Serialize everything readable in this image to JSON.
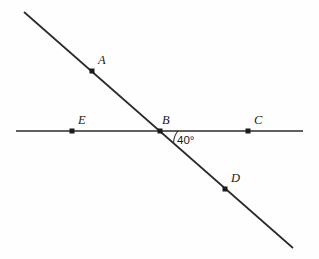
{
  "figure": {
    "background_color": "#fefefe",
    "stroke_color": "#2b2b2b",
    "dot_color": "#1a1a1a",
    "angle_measure": "40°",
    "points": [
      {
        "label": "A",
        "dot_x": 92,
        "dot_y": 71,
        "label_x": 98,
        "label_y": 64
      },
      {
        "label": "B",
        "dot_x": 160,
        "dot_y": 131,
        "label_x": 162,
        "label_y": 124
      },
      {
        "label": "C",
        "dot_x": 248,
        "dot_y": 131,
        "label_x": 254,
        "label_y": 124
      },
      {
        "label": "D",
        "dot_x": 225,
        "dot_y": 189,
        "label_x": 231,
        "label_y": 182
      },
      {
        "label": "E",
        "dot_x": 72,
        "dot_y": 131,
        "label_x": 78,
        "label_y": 124
      }
    ],
    "lines": [
      {
        "name": "horizontal-line-EC",
        "x1": 16,
        "y1": 131,
        "x2": 303,
        "y2": 131
      },
      {
        "name": "diagonal-line-AD",
        "x1": 24,
        "y1": 12,
        "x2": 293,
        "y2": 248
      }
    ],
    "angle": {
      "vertex_x": 160,
      "vertex_y": 131,
      "label_x": 177,
      "label_y": 144,
      "arc_path": "M 178 131 A 18 18 0 0 0 173.6 142.4"
    }
  }
}
